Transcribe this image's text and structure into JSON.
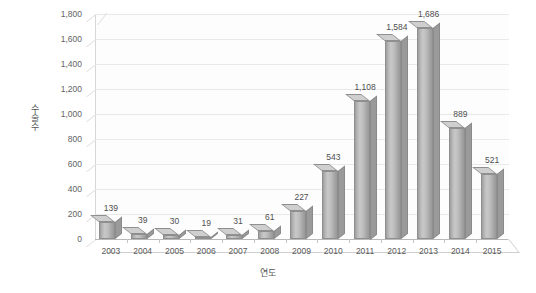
{
  "chart_data": {
    "type": "bar",
    "title": "",
    "subtitle": "",
    "xlabel": "연도",
    "ylabel": "수술수",
    "categories": [
      "2003",
      "2004",
      "2005",
      "2006",
      "2007",
      "2008",
      "2009",
      "2010",
      "2011",
      "2012",
      "2013",
      "2014",
      "2015"
    ],
    "values": [
      139,
      39,
      30,
      19,
      31,
      61,
      227,
      543,
      1108,
      1584,
      1686,
      889,
      521
    ],
    "value_labels": [
      "139",
      "39",
      "30",
      "19",
      "31",
      "61",
      "227",
      "543",
      "1,108",
      "1,584",
      "1,686",
      "889",
      "521"
    ],
    "ylim": [
      0,
      1800
    ],
    "ytick_step": 200,
    "ytick_labels": [
      "0",
      "200",
      "400",
      "600",
      "800",
      "1,000",
      "1,200",
      "1,400",
      "1,600",
      "1,800"
    ],
    "ytick_values": [
      0,
      200,
      400,
      600,
      800,
      1000,
      1200,
      1400,
      1600,
      1800
    ],
    "grid": true,
    "grid_axis": "y",
    "legend": false,
    "legend_position": "none",
    "series": [
      {
        "name": "수술수",
        "values": [
          139,
          39,
          30,
          19,
          31,
          61,
          227,
          543,
          1108,
          1584,
          1686,
          889,
          521
        ]
      }
    ],
    "style": {
      "three_d": true,
      "bar_face_color": "#bdbdbd",
      "bar_side_color": "#9a9a9a",
      "bar_top_color": "#cfcfcf",
      "bar_border_color": "#8f8f8f",
      "grid_color": "#e9e9e9",
      "axis_color": "#b8b8b8",
      "background_color": "#ffffff",
      "text_color": "#4f4f4f"
    }
  }
}
